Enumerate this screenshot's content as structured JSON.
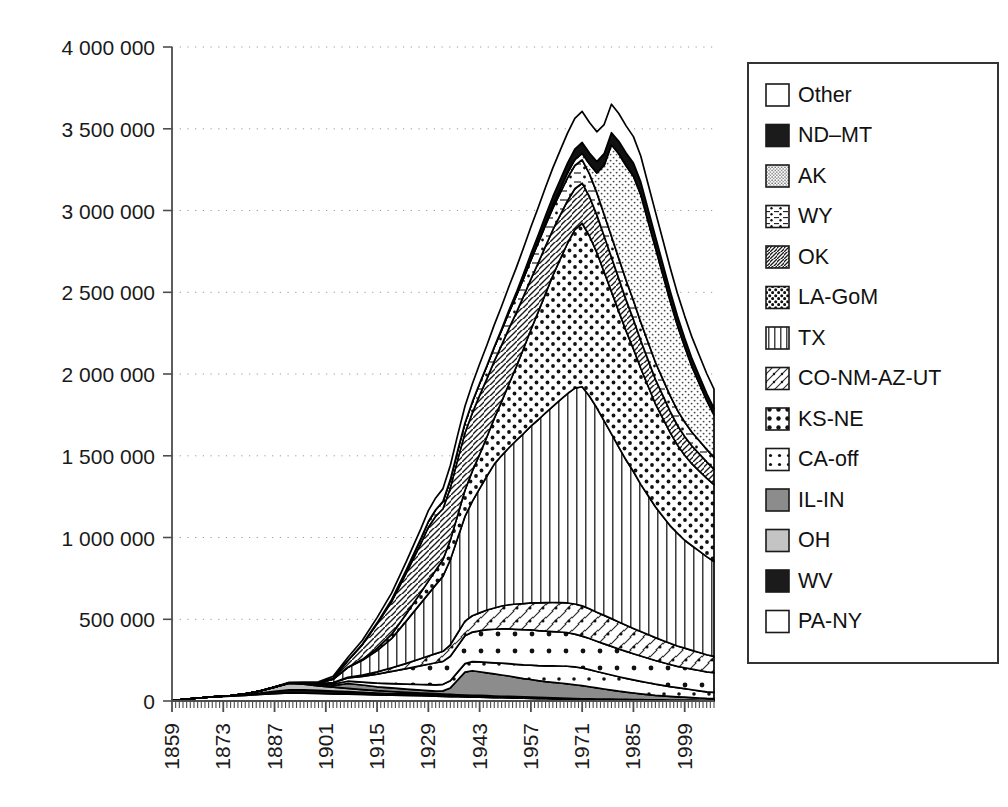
{
  "chart_data": {
    "type": "area",
    "stacked": true,
    "title": "",
    "xlabel": "",
    "ylabel": "",
    "xlim": [
      1859,
      2007
    ],
    "ylim": [
      0,
      4000000
    ],
    "ytick_labels": [
      "0",
      "500 000",
      "1 000 000",
      "1 500 000",
      "2 000 000",
      "2 500 000",
      "3 000 000",
      "3 500 000",
      "4 000 000"
    ],
    "ytick_values": [
      0,
      500000,
      1000000,
      1500000,
      2000000,
      2500000,
      3000000,
      3500000,
      4000000
    ],
    "xtick_labels": [
      "1859",
      "1873",
      "1887",
      "1901",
      "1915",
      "1929",
      "1943",
      "1957",
      "1971",
      "1985",
      "1999"
    ],
    "xtick_values": [
      1859,
      1873,
      1887,
      1901,
      1915,
      1929,
      1943,
      1957,
      1971,
      1985,
      1999
    ],
    "grid": "horizontal-dotted",
    "legend_position": "right",
    "x": [
      1859,
      1863,
      1867,
      1871,
      1875,
      1879,
      1883,
      1887,
      1891,
      1895,
      1899,
      1903,
      1907,
      1911,
      1915,
      1919,
      1923,
      1927,
      1929,
      1931,
      1933,
      1935,
      1937,
      1939,
      1941,
      1943,
      1945,
      1947,
      1949,
      1951,
      1953,
      1955,
      1957,
      1959,
      1961,
      1963,
      1965,
      1967,
      1969,
      1971,
      1973,
      1975,
      1977,
      1979,
      1981,
      1983,
      1985,
      1987,
      1989,
      1991,
      1993,
      1995,
      1997,
      1999,
      2001,
      2003,
      2005,
      2007
    ],
    "series": [
      {
        "name": "PA-NY",
        "pattern": "empty",
        "values": [
          2000,
          12000,
          20000,
          26000,
          30000,
          35000,
          40000,
          45000,
          50000,
          48000,
          46000,
          44000,
          42000,
          40000,
          38000,
          36000,
          34000,
          32000,
          31000,
          30000,
          28000,
          27000,
          26000,
          25000,
          24000,
          23000,
          22000,
          21000,
          20000,
          19000,
          18000,
          17000,
          16000,
          15000,
          14000,
          13000,
          12000,
          11000,
          10000,
          9000,
          8500,
          8000,
          7500,
          7000,
          6500,
          6000,
          5500,
          5000,
          4500,
          4000,
          3800,
          3500,
          3200,
          3000,
          2800,
          2600,
          2400,
          2200
        ]
      },
      {
        "name": "WV",
        "pattern": "solid-black",
        "values": [
          0,
          0,
          0,
          500,
          2000,
          5000,
          9000,
          14000,
          18000,
          20000,
          19000,
          17000,
          15000,
          13000,
          11000,
          10000,
          9000,
          8000,
          7500,
          7000,
          6500,
          6000,
          5500,
          5200,
          5000,
          4800,
          4500,
          4200,
          4000,
          3800,
          3600,
          3400,
          3200,
          3000,
          2800,
          2600,
          2400,
          2200,
          2000,
          1900,
          1800,
          1700,
          1600,
          1500,
          1400,
          1300,
          1200,
          1100,
          1000,
          950,
          900,
          850,
          800,
          750,
          700,
          650,
          600,
          550
        ]
      },
      {
        "name": "OH",
        "pattern": "light-gray",
        "values": [
          0,
          0,
          0,
          0,
          1000,
          4000,
          12000,
          25000,
          40000,
          35000,
          28000,
          24000,
          20000,
          17000,
          14000,
          12000,
          10000,
          9000,
          8500,
          8000,
          7500,
          7000,
          6800,
          6500,
          6200,
          6000,
          5800,
          5500,
          5200,
          5000,
          4800,
          4600,
          4400,
          4200,
          4000,
          3800,
          3600,
          3400,
          3200,
          3000,
          2800,
          2600,
          2500,
          2400,
          2300,
          2200,
          2100,
          2000,
          1900,
          1800,
          1700,
          1600,
          1500,
          1400,
          1300,
          1200,
          1100,
          1000
        ]
      },
      {
        "name": "IL-IN",
        "pattern": "mid-gray",
        "values": [
          0,
          0,
          0,
          0,
          0,
          0,
          0,
          500,
          2000,
          4000,
          6000,
          9000,
          30000,
          28000,
          24000,
          22000,
          20000,
          18000,
          17000,
          16000,
          20000,
          40000,
          90000,
          140000,
          150000,
          145000,
          140000,
          135000,
          130000,
          125000,
          118000,
          112000,
          108000,
          102000,
          98000,
          95000,
          92000,
          88000,
          84000,
          80000,
          74000,
          68000,
          62000,
          56000,
          50000,
          45000,
          40000,
          36000,
          32000,
          28000,
          25000,
          22000,
          20000,
          18000,
          16000,
          14000,
          12000,
          11000
        ]
      },
      {
        "name": "CA-off",
        "pattern": "dot-corner",
        "values": [
          0,
          0,
          0,
          0,
          0,
          0,
          0,
          0,
          0,
          2000,
          6000,
          10000,
          14000,
          18000,
          22000,
          26000,
          30000,
          34000,
          36000,
          38000,
          40000,
          44000,
          48000,
          52000,
          56000,
          60000,
          64000,
          68000,
          72000,
          76000,
          80000,
          84000,
          88000,
          92000,
          96000,
          100000,
          104000,
          108000,
          110000,
          108000,
          105000,
          100000,
          96000,
          92000,
          88000,
          84000,
          80000,
          76000,
          72000,
          68000,
          64000,
          60000,
          56000,
          52000,
          48000,
          44000,
          40000,
          38000
        ]
      },
      {
        "name": "KS-NE",
        "pattern": "dot-grid-big",
        "values": [
          0,
          0,
          0,
          0,
          0,
          0,
          0,
          0,
          0,
          0,
          2000,
          8000,
          20000,
          35000,
          55000,
          75000,
          95000,
          115000,
          125000,
          135000,
          140000,
          150000,
          160000,
          170000,
          180000,
          190000,
          200000,
          205000,
          210000,
          212000,
          214000,
          215000,
          216000,
          214000,
          212000,
          210000,
          208000,
          205000,
          200000,
          195000,
          190000,
          185000,
          180000,
          175000,
          170000,
          165000,
          160000,
          155000,
          150000,
          145000,
          140000,
          135000,
          130000,
          128000,
          126000,
          124000,
          122000,
          120000
        ]
      },
      {
        "name": "CO-NM-AZ-UT",
        "pattern": "diag-dot",
        "values": [
          0,
          0,
          0,
          0,
          0,
          0,
          0,
          0,
          0,
          0,
          0,
          1000,
          4000,
          8000,
          14000,
          22000,
          32000,
          44000,
          50000,
          56000,
          62000,
          70000,
          80000,
          90000,
          100000,
          110000,
          120000,
          130000,
          140000,
          148000,
          155000,
          160000,
          165000,
          170000,
          175000,
          178000,
          180000,
          182000,
          184000,
          185000,
          182000,
          178000,
          174000,
          170000,
          165000,
          160000,
          155000,
          150000,
          145000,
          140000,
          135000,
          130000,
          125000,
          120000,
          115000,
          110000,
          105000,
          100000
        ]
      },
      {
        "name": "TX",
        "pattern": "vertical-lines",
        "values": [
          0,
          0,
          0,
          0,
          0,
          0,
          0,
          0,
          0,
          0,
          2000,
          20000,
          60000,
          90000,
          130000,
          180000,
          260000,
          340000,
          380000,
          420000,
          460000,
          520000,
          580000,
          640000,
          700000,
          760000,
          820000,
          880000,
          920000,
          960000,
          1000000,
          1040000,
          1080000,
          1120000,
          1160000,
          1200000,
          1240000,
          1280000,
          1320000,
          1340000,
          1300000,
          1250000,
          1190000,
          1130000,
          1070000,
          1010000,
          960000,
          900000,
          850000,
          800000,
          760000,
          720000,
          690000,
          660000,
          640000,
          620000,
          600000,
          580000
        ]
      },
      {
        "name": "LA-GoM",
        "pattern": "dense-dots",
        "values": [
          0,
          0,
          0,
          0,
          0,
          0,
          0,
          0,
          0,
          0,
          0,
          0,
          2000,
          6000,
          14000,
          26000,
          44000,
          66000,
          78000,
          90000,
          102000,
          120000,
          140000,
          160000,
          185000,
          210000,
          240000,
          280000,
          330000,
          390000,
          450000,
          520000,
          590000,
          660000,
          730000,
          800000,
          860000,
          920000,
          970000,
          1000000,
          980000,
          950000,
          910000,
          870000,
          830000,
          790000,
          750000,
          710000,
          670000,
          630000,
          600000,
          570000,
          540000,
          520000,
          500000,
          490000,
          480000,
          470000
        ]
      },
      {
        "name": "OK",
        "pattern": "diag-hatch",
        "values": [
          0,
          0,
          0,
          0,
          0,
          0,
          0,
          0,
          0,
          0,
          0,
          6000,
          40000,
          90000,
          150000,
          200000,
          250000,
          300000,
          330000,
          330000,
          310000,
          320000,
          340000,
          350000,
          355000,
          360000,
          355000,
          350000,
          345000,
          340000,
          330000,
          320000,
          310000,
          300000,
          290000,
          280000,
          270000,
          260000,
          250000,
          245000,
          240000,
          230000,
          220000,
          210000,
          200000,
          190000,
          180000,
          170000,
          160000,
          150000,
          140000,
          130000,
          120000,
          115000,
          110000,
          105000,
          100000,
          95000
        ]
      },
      {
        "name": "WY",
        "pattern": "dash-dot",
        "values": [
          0,
          0,
          0,
          0,
          0,
          0,
          0,
          0,
          0,
          0,
          0,
          0,
          1000,
          3000,
          6000,
          12000,
          20000,
          30000,
          35000,
          40000,
          45000,
          50000,
          56000,
          62000,
          68000,
          74000,
          80000,
          86000,
          92000,
          98000,
          104000,
          110000,
          116000,
          122000,
          128000,
          132000,
          136000,
          140000,
          142000,
          143000,
          140000,
          136000,
          132000,
          128000,
          124000,
          120000,
          116000,
          112000,
          108000,
          104000,
          100000,
          96000,
          92000,
          88000,
          84000,
          80000,
          76000,
          72000
        ]
      },
      {
        "name": "AK",
        "pattern": "fine-dots",
        "values": [
          0,
          0,
          0,
          0,
          0,
          0,
          0,
          0,
          0,
          0,
          0,
          0,
          0,
          0,
          0,
          0,
          0,
          0,
          0,
          0,
          0,
          0,
          0,
          0,
          0,
          0,
          0,
          0,
          0,
          0,
          0,
          0,
          2000,
          6000,
          12000,
          18000,
          24000,
          30000,
          36000,
          40000,
          60000,
          120000,
          300000,
          560000,
          640000,
          700000,
          760000,
          780000,
          740000,
          700000,
          640000,
          580000,
          520000,
          460000,
          400000,
          350000,
          300000,
          260000
        ]
      },
      {
        "name": "ND–MT",
        "pattern": "solid-black",
        "values": [
          0,
          0,
          0,
          0,
          0,
          0,
          0,
          0,
          0,
          0,
          0,
          0,
          0,
          0,
          0,
          0,
          0,
          0,
          0,
          0,
          0,
          0,
          0,
          0,
          0,
          0,
          0,
          2000,
          6000,
          12000,
          20000,
          28000,
          36000,
          42000,
          48000,
          52000,
          56000,
          60000,
          64000,
          66000,
          68000,
          70000,
          72000,
          74000,
          76000,
          78000,
          80000,
          78000,
          74000,
          70000,
          66000,
          62000,
          58000,
          54000,
          50000,
          46000,
          42000,
          40000
        ]
      },
      {
        "name": "Other",
        "pattern": "empty",
        "values": [
          0,
          0,
          0,
          0,
          0,
          0,
          1000,
          2000,
          4000,
          6000,
          8000,
          12000,
          18000,
          24000,
          32000,
          40000,
          50000,
          60000,
          66000,
          72000,
          78000,
          86000,
          94000,
          102000,
          110000,
          118000,
          126000,
          134000,
          140000,
          146000,
          152000,
          158000,
          164000,
          168000,
          172000,
          176000,
          180000,
          184000,
          188000,
          190000,
          186000,
          182000,
          178000,
          174000,
          170000,
          166000,
          162000,
          158000,
          154000,
          150000,
          146000,
          142000,
          138000,
          134000,
          130000,
          126000,
          122000,
          118000
        ]
      }
    ]
  },
  "legend": {
    "items": [
      {
        "label": "Other",
        "pattern": "empty"
      },
      {
        "label": "ND–MT",
        "pattern": "solid-black"
      },
      {
        "label": "AK",
        "pattern": "fine-dots"
      },
      {
        "label": "WY",
        "pattern": "dash-dot"
      },
      {
        "label": "OK",
        "pattern": "diag-hatch"
      },
      {
        "label": "LA-GoM",
        "pattern": "dense-dots"
      },
      {
        "label": "TX",
        "pattern": "vertical-lines"
      },
      {
        "label": "CO-NM-AZ-UT",
        "pattern": "diag-dot"
      },
      {
        "label": "KS-NE",
        "pattern": "dot-grid-big"
      },
      {
        "label": "CA-off",
        "pattern": "dot-corner"
      },
      {
        "label": "IL-IN",
        "pattern": "mid-gray"
      },
      {
        "label": "OH",
        "pattern": "light-gray"
      },
      {
        "label": "WV",
        "pattern": "solid-black"
      },
      {
        "label": "PA-NY",
        "pattern": "empty"
      }
    ]
  },
  "colors": {
    "axis": "#4d4d4d",
    "grid": "#9a9a9a",
    "outline": "#000000",
    "mid_gray": "#8c8c8c",
    "light_gray": "#bfbfbf",
    "black": "#111111",
    "background": "#ffffff"
  }
}
